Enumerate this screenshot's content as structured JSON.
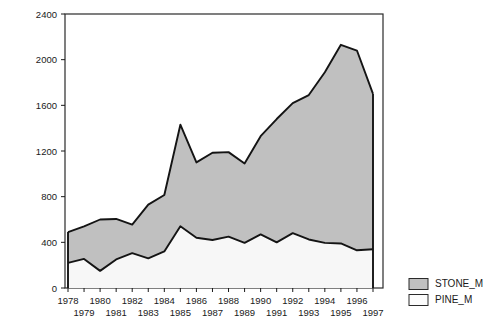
{
  "chart_data": {
    "type": "area",
    "title": "",
    "subtitle": "",
    "xlabel": "",
    "ylabel": "",
    "stacked": true,
    "grid": false,
    "legend_position": "right-bottom",
    "xlim": [
      1978,
      1997
    ],
    "ylim": [
      0,
      2400
    ],
    "ytick_labels": [
      "0",
      "400",
      "800",
      "1200",
      "1600",
      "2000",
      "2400"
    ],
    "ytick_values": [
      0,
      400,
      800,
      1200,
      1600,
      2000,
      2400
    ],
    "categories": [
      1978,
      1979,
      1980,
      1981,
      1982,
      1983,
      1984,
      1985,
      1986,
      1987,
      1988,
      1989,
      1990,
      1991,
      1992,
      1993,
      1994,
      1995,
      1996,
      1997
    ],
    "xtick_labels": [
      "1978",
      "1979",
      "1980",
      "1981",
      "1982",
      "1983",
      "1984",
      "1985",
      "1986",
      "1987",
      "1988",
      "1989",
      "1990",
      "1991",
      "1992",
      "1993",
      "1994",
      "1995",
      "1996",
      "1997"
    ],
    "xtick_row_top": [
      "1978",
      "1980",
      "1982",
      "1984",
      "1986",
      "1988",
      "1990",
      "1992",
      "1994",
      "1996"
    ],
    "xtick_row_bottom": [
      "1979",
      "1981",
      "1983",
      "1985",
      "1987",
      "1989",
      "1991",
      "1993",
      "1995",
      "1997"
    ],
    "series": [
      {
        "name": "PINE_M",
        "color": "#f5f5f5",
        "line_color": "#141414",
        "values": [
          220,
          255,
          150,
          250,
          305,
          260,
          320,
          540,
          440,
          420,
          450,
          395,
          470,
          400,
          480,
          425,
          395,
          390,
          330,
          340
        ]
      },
      {
        "name": "STONE_M",
        "color": "#c0c0c0",
        "line_color": "#141414",
        "values": [
          270,
          285,
          450,
          355,
          250,
          470,
          495,
          890,
          660,
          765,
          740,
          695,
          860,
          1080,
          1140,
          1265,
          1495,
          1740,
          1750,
          1360
        ]
      }
    ],
    "series_totals": {
      "name": "STONE_M + PINE_M (stack top)",
      "values": [
        490,
        540,
        600,
        605,
        555,
        730,
        815,
        1430,
        1100,
        1185,
        1190,
        1090,
        1330,
        1480,
        1620,
        1690,
        1890,
        2130,
        2080,
        1700
      ]
    }
  },
  "legend": {
    "entries": [
      {
        "label": "STONE_M",
        "swatch_color": "#c0c0c0"
      },
      {
        "label": "PINE_M",
        "swatch_color": "#fcfcfc"
      }
    ]
  },
  "colors": {
    "stone_fill": "#c0c0c0",
    "pine_fill": "#f7f7f7",
    "line": "#141414",
    "axis": "#1a1a1a",
    "text": "#1a1a1a",
    "background": "#ffffff"
  }
}
